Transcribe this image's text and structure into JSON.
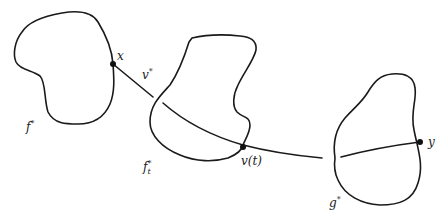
{
  "figure": {
    "regions": [
      {
        "id": "f_star",
        "label": "f",
        "sup": "*",
        "sub": ""
      },
      {
        "id": "f_t_star",
        "label": "f",
        "sup": "*",
        "sub": "t"
      },
      {
        "id": "g_star",
        "label": "g",
        "sup": "*",
        "sub": ""
      }
    ],
    "points": [
      {
        "id": "x",
        "label": "x"
      },
      {
        "id": "v_t",
        "label": "v(t)"
      },
      {
        "id": "y",
        "label": "y"
      }
    ],
    "path": {
      "id": "v_star",
      "label": "v",
      "sup": "*"
    },
    "colors": {
      "stroke": "#1a1a1a",
      "background": "#ffffff"
    }
  }
}
